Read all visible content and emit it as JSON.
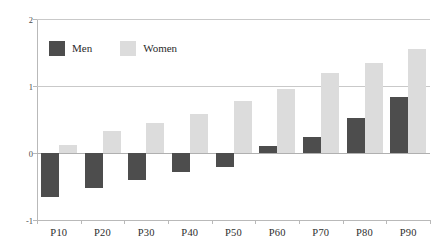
{
  "chart_data": {
    "type": "bar",
    "title": "",
    "subtitle": "",
    "xlabel": "",
    "ylabel": "",
    "ylim": [
      -1,
      2
    ],
    "yticks": [
      "-1",
      "0",
      "1",
      "2"
    ],
    "grid": true,
    "legend_position": "top-left",
    "categories": [
      "P10",
      "P20",
      "P30",
      "P40",
      "P50",
      "P60",
      "P70",
      "P80",
      "P90"
    ],
    "series": [
      {
        "name": "Men",
        "color": "#4d4d4d",
        "values": [
          -0.65,
          -0.52,
          -0.4,
          -0.28,
          -0.21,
          0.1,
          0.24,
          0.52,
          0.83
        ]
      },
      {
        "name": "Women",
        "color": "#dcdcdc",
        "values": [
          0.12,
          0.33,
          0.45,
          0.58,
          0.78,
          0.95,
          1.19,
          1.34,
          1.55
        ]
      }
    ]
  },
  "legend": {
    "items": [
      {
        "label": "Men",
        "color": "#4d4d4d"
      },
      {
        "label": "Women",
        "color": "#dcdcdc"
      }
    ]
  },
  "axes": {
    "y": {
      "ticks": [
        "2",
        "1",
        "0",
        "-1"
      ]
    },
    "x": {
      "ticks": [
        "P10",
        "P20",
        "P30",
        "P40",
        "P50",
        "P60",
        "P70",
        "P80",
        "P90"
      ]
    }
  }
}
